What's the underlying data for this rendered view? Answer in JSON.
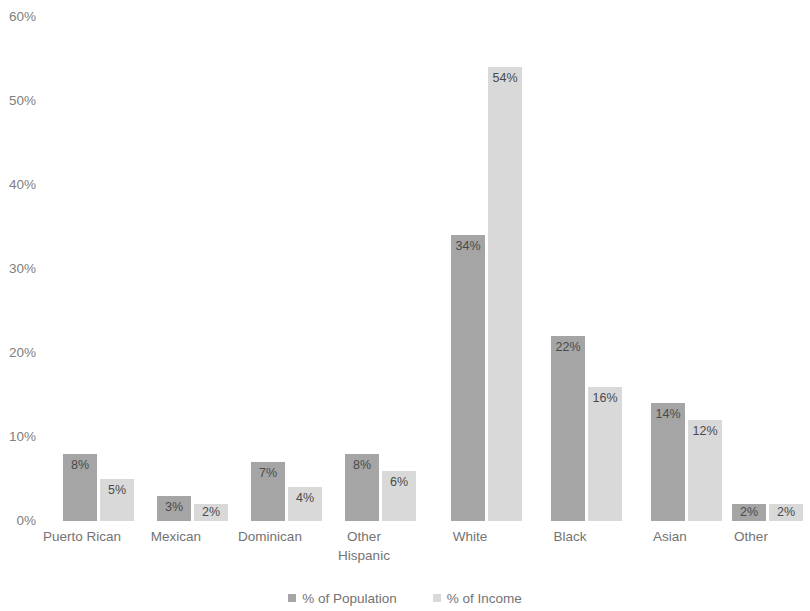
{
  "chart_data": {
    "type": "bar",
    "title": "",
    "subtitle": "",
    "xlabel": "",
    "ylabel": "",
    "ylim": [
      0,
      60
    ],
    "ytick_labels": [
      "60%",
      "50%",
      "40%",
      "30%",
      "20%",
      "10%",
      "0%"
    ],
    "ytick_values": [
      60,
      50,
      40,
      30,
      20,
      10,
      0
    ],
    "grid": false,
    "legend_position": "bottom",
    "categories": [
      "Puerto Rican",
      "Mexican",
      "Dominican",
      "Other\nHispanic",
      "White",
      "Black",
      "Asian",
      "Other"
    ],
    "series": [
      {
        "name": "% of Population",
        "color": "#a5a5a5",
        "values": [
          8,
          3,
          7,
          8,
          34,
          22,
          14,
          2
        ],
        "labels": [
          "8%",
          "3%",
          "7%",
          "8%",
          "34%",
          "22%",
          "14%",
          "2%"
        ]
      },
      {
        "name": "% of Income",
        "color": "#d9d9d9",
        "values": [
          5,
          2,
          4,
          6,
          54,
          16,
          12,
          2
        ],
        "labels": [
          "5%",
          "2%",
          "4%",
          "6%",
          "54%",
          "16%",
          "12%",
          "2%"
        ]
      }
    ]
  },
  "legend": {
    "items": [
      {
        "label": "% of Population",
        "swatch": "pop"
      },
      {
        "label": "% of Income",
        "swatch": "inc"
      }
    ]
  }
}
